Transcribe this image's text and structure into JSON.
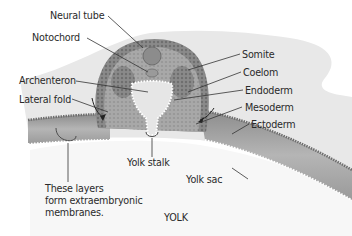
{
  "diagram": {
    "labels": {
      "neural_tube": "Neural tube",
      "notochord": "Notochord",
      "somite": "Somite",
      "coelom": "Coelom",
      "archenteron": "Archenteron",
      "endoderm": "Endoderm",
      "lateral_fold": "Lateral fold",
      "mesoderm": "Mesoderm",
      "ectoderm": "Ectoderm",
      "yolk_stalk": "Yolk stalk",
      "yolk_sac": "Yolk sac",
      "yolk": "YOLK",
      "note_line1": "These layers",
      "note_line2": "form extraembryonic",
      "note_line3": "membranes."
    },
    "colors": {
      "background": "#ffffff",
      "albumen": "#e9e9e9",
      "ectoderm_dark": "#7a7a7a",
      "mesoderm_mid": "#a3a3a3",
      "endoderm_light": "#d6d6d6",
      "yolk": "#f6f6f6",
      "text": "#2a2a2a"
    }
  }
}
